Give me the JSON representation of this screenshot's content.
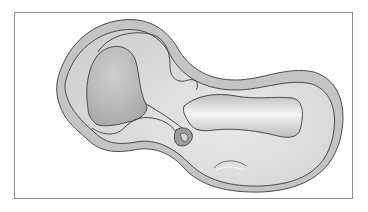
{
  "figure": {
    "type": "anatomical-illustration",
    "labels": [],
    "colors": {
      "frame_border": "#8a8a8a",
      "background": "#ffffff",
      "outer_band": "#c4c4c4",
      "inner_fill": "#e2e2e2",
      "body_fill": "#dadada",
      "shaded_lobe": "#b9b9b9",
      "outline": "#4a4a4a"
    }
  }
}
